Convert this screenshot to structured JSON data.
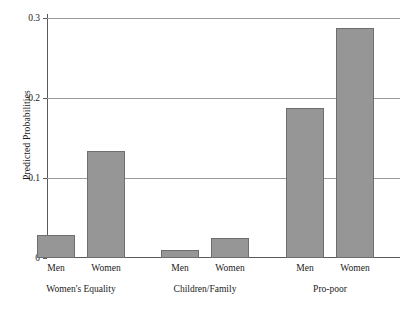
{
  "chart_data": {
    "type": "bar",
    "title": "",
    "subtitle": "",
    "xlabel": "",
    "ylabel": "Predicted Probabilities",
    "ylim": [
      0,
      0.3
    ],
    "yticks": [
      0,
      0.1,
      0.2,
      0.3
    ],
    "ytick_labels": [
      "0",
      "0.1",
      "0.2",
      "0.3"
    ],
    "grid": true,
    "grid_axis": "y",
    "legend": "none",
    "bar_color": "#969696",
    "bar_edge_color": "#6e6e6e",
    "axis_color": "#5a5a5a",
    "grid_color": "#9a9a9a",
    "background": "#ffffff",
    "groups": [
      {
        "name": "Women's Equality",
        "categories": [
          "Men",
          "Women"
        ],
        "values": [
          0.029,
          0.134
        ]
      },
      {
        "name": "Children/Family",
        "categories": [
          "Men",
          "Women"
        ],
        "values": [
          0.01,
          0.025
        ]
      },
      {
        "name": "Pro-poor",
        "categories": [
          "Men",
          "Women"
        ],
        "values": [
          0.188,
          0.287
        ]
      }
    ],
    "categories": [
      "Men",
      "Women",
      "Men",
      "Women",
      "Men",
      "Women"
    ],
    "values": [
      0.029,
      0.134,
      0.01,
      0.025,
      0.188,
      0.287
    ],
    "group_names": [
      "Women's Equality",
      "Children/Family",
      "Pro-poor"
    ]
  },
  "axes": {
    "y_title": "Predicted Probabilities",
    "y_tick_0": "0",
    "y_tick_1": "0.1",
    "y_tick_2": "0.2",
    "y_tick_3": "0.3"
  },
  "bars": [
    {
      "label": "Men",
      "group": "Women's Equality",
      "value": 0.029
    },
    {
      "label": "Women",
      "group": "Women's Equality",
      "value": 0.134
    },
    {
      "label": "Men",
      "group": "Children/Family",
      "value": 0.01
    },
    {
      "label": "Women",
      "group": "Children/Family",
      "value": 0.025
    },
    {
      "label": "Men",
      "group": "Pro-poor",
      "value": 0.188
    },
    {
      "label": "Women",
      "group": "Pro-poor",
      "value": 0.287
    }
  ],
  "group_titles": [
    "Women's Equality",
    "Children/Family",
    "Pro-poor"
  ]
}
